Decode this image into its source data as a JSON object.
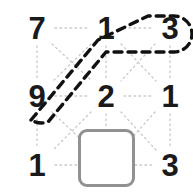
{
  "canvas": {
    "width": 193,
    "height": 195,
    "background": "#ffffff"
  },
  "puzzle": {
    "title": "number-grid-path",
    "columns_x": [
      37,
      106,
      170
    ],
    "rows_y": [
      28,
      96,
      165
    ],
    "cells": [
      {
        "id": "r0c0",
        "row": 0,
        "col": 0,
        "type": "digit",
        "value": "7"
      },
      {
        "id": "r0c1",
        "row": 0,
        "col": 1,
        "type": "digit",
        "value": "1"
      },
      {
        "id": "r0c2",
        "row": 0,
        "col": 2,
        "type": "digit",
        "value": "3"
      },
      {
        "id": "r1c0",
        "row": 1,
        "col": 0,
        "type": "digit",
        "value": "9"
      },
      {
        "id": "r1c1",
        "row": 1,
        "col": 1,
        "type": "digit",
        "value": "2"
      },
      {
        "id": "r1c2",
        "row": 1,
        "col": 2,
        "type": "digit",
        "value": "1"
      },
      {
        "id": "r2c0",
        "row": 2,
        "col": 0,
        "type": "digit",
        "value": "1"
      },
      {
        "id": "r2c1",
        "row": 2,
        "col": 1,
        "type": "box",
        "value": ""
      },
      {
        "id": "r2c2",
        "row": 2,
        "col": 2,
        "type": "digit",
        "value": "3"
      }
    ],
    "digit_color": "#1a1a1a",
    "digit_font_size": 31
  },
  "box": {
    "name": "empty-slot",
    "x": 78,
    "y": 129,
    "width": 57,
    "height": 58,
    "corner_radius": 9,
    "border_width": 3,
    "border_color": "#919191",
    "fill_color": "#ffffff"
  },
  "grid_lines": {
    "color": "#c9c9c9",
    "width": 1.3,
    "dash": "1.6 3.4",
    "segments": [
      {
        "name": "h-r0-c0-c1",
        "x1": 55,
        "y1": 28,
        "x2": 88,
        "y2": 28
      },
      {
        "name": "h-r0-c1-c2",
        "x1": 124,
        "y1": 28,
        "x2": 152,
        "y2": 28
      },
      {
        "name": "h-r1-c0-c1",
        "x1": 55,
        "y1": 96,
        "x2": 88,
        "y2": 96
      },
      {
        "name": "h-r1-c1-c2",
        "x1": 124,
        "y1": 96,
        "x2": 152,
        "y2": 96
      },
      {
        "name": "h-r2-c0-c1",
        "x1": 55,
        "y1": 165,
        "x2": 78,
        "y2": 165
      },
      {
        "name": "h-r2-c1-c2",
        "x1": 135,
        "y1": 165,
        "x2": 152,
        "y2": 165
      },
      {
        "name": "v-c0-r0-r1",
        "x1": 37,
        "y1": 46,
        "x2": 37,
        "y2": 78
      },
      {
        "name": "v-c1-r0-r1",
        "x1": 106,
        "y1": 46,
        "x2": 106,
        "y2": 78
      },
      {
        "name": "v-c2-r0-r1",
        "x1": 170,
        "y1": 46,
        "x2": 170,
        "y2": 78
      },
      {
        "name": "v-c0-r1-r2",
        "x1": 37,
        "y1": 114,
        "x2": 37,
        "y2": 147
      },
      {
        "name": "v-c1-r1-r2",
        "x1": 106,
        "y1": 114,
        "x2": 106,
        "y2": 129
      },
      {
        "name": "v-c2-r1-r2",
        "x1": 170,
        "y1": 114,
        "x2": 170,
        "y2": 147
      },
      {
        "name": "d-r0c0-r1c1",
        "x1": 52,
        "y1": 44,
        "x2": 92,
        "y2": 81
      },
      {
        "name": "d-r0c1-r1c0",
        "x1": 91,
        "y1": 44,
        "x2": 53,
        "y2": 81
      },
      {
        "name": "d-r0c1-r1c2",
        "x1": 121,
        "y1": 44,
        "x2": 156,
        "y2": 81
      },
      {
        "name": "d-r0c2-r1c1",
        "x1": 155,
        "y1": 44,
        "x2": 121,
        "y2": 81
      },
      {
        "name": "d-r1c0-r2c1",
        "x1": 52,
        "y1": 112,
        "x2": 92,
        "y2": 150
      },
      {
        "name": "d-r1c1-r2c0",
        "x1": 91,
        "y1": 112,
        "x2": 53,
        "y2": 150
      },
      {
        "name": "d-r1c1-r2c2",
        "x1": 121,
        "y1": 112,
        "x2": 156,
        "y2": 150
      },
      {
        "name": "d-r1c2-r2c1",
        "x1": 155,
        "y1": 112,
        "x2": 121,
        "y2": 150
      }
    ]
  },
  "highlight": {
    "name": "selected-path-outline",
    "shape": "stadium",
    "color": "#111111",
    "stroke_width": 3.4,
    "dash": "8 6",
    "path": "M 31 120 L 98 40 L 148 16 L 174 16 A 18 18 0 0 1 174 52 L 106 52 L 48 122 A 21 21 0 0 1 31 120 Z",
    "covers_cells": [
      "r1c0",
      "r0c1",
      "r0c2"
    ],
    "covers_values": [
      "9",
      "1",
      "3"
    ]
  }
}
